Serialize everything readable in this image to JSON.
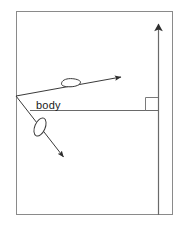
{
  "figure": {
    "kind": "physics-free-body-vector-diagram",
    "background_color": "#ffffff",
    "frame_color": "#8a8a8a",
    "line_color": "#555555",
    "vector_color": "#3a3a3a",
    "text_color": "#1a1a1a",
    "width": 182,
    "height": 226
  },
  "frame": {
    "name": "outer-border",
    "x": 16,
    "y": 11,
    "width": 157,
    "height": 204
  },
  "labels": {
    "body": "body"
  },
  "elements": {
    "vertex": {
      "x": 16,
      "y": 96
    },
    "horizontal_reference_line": {
      "x1": 30,
      "y1": 110,
      "x2": 158,
      "y2": 110
    },
    "vertical_axis_arrow": {
      "x1": 158,
      "y1": 215,
      "x2": 158,
      "y2": 16
    },
    "right_angle_marker": {
      "x": 145,
      "y": 97,
      "size": 13
    },
    "upper_vector": {
      "x1": 16,
      "y1": 96,
      "x2": 128,
      "y2": 76
    },
    "lower_vector": {
      "x1": 16,
      "y1": 96,
      "x2": 68,
      "y2": 163
    },
    "upper_body_blob": {
      "cx": 71,
      "cy": 83,
      "rx": 10,
      "ry": 4,
      "rotation": -9
    },
    "lower_body_blob": {
      "cx": 40,
      "cy": 127,
      "rx": 5,
      "ry": 10,
      "rotation": 23
    }
  },
  "annotations": {
    "body_label_position": {
      "x": 36,
      "y": 109
    }
  }
}
